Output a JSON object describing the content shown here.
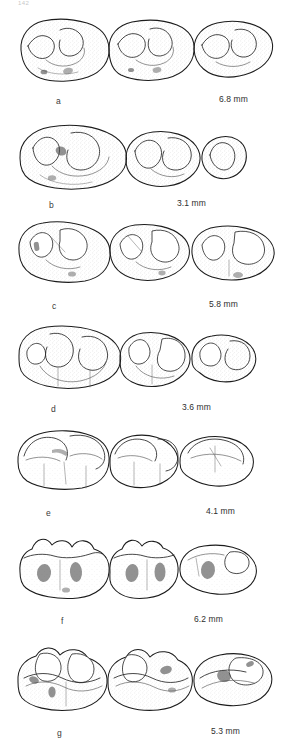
{
  "figure": {
    "page_header": "142",
    "caption_style": "letter-left, scale-right",
    "units": "mm",
    "ink_color": "#1b1b1b",
    "background_color": "#ffffff"
  },
  "rows": [
    {
      "id": "row-a",
      "letter": "a",
      "scale": "6.8 mm",
      "teeth": 3,
      "view": "occlusal",
      "letter_x": 56,
      "letter_y": 96,
      "scale_x": 219,
      "scale_y": 94
    },
    {
      "id": "row-b",
      "letter": "b",
      "scale": "3.1 mm",
      "teeth": 3,
      "view": "occlusal",
      "letter_x": 49,
      "letter_y": 190,
      "scale_x": 177,
      "scale_y": 188
    },
    {
      "id": "row-c",
      "letter": "c",
      "scale": "5.8 mm",
      "teeth": 3,
      "view": "occlusal",
      "letter_x": 52,
      "letter_y": 297,
      "scale_x": 209,
      "scale_y": 295
    },
    {
      "id": "row-d",
      "letter": "d",
      "scale": "3.6 mm",
      "teeth": 3,
      "view": "occlusal",
      "letter_x": 51,
      "letter_y": 403,
      "scale_x": 182,
      "scale_y": 401
    },
    {
      "id": "row-e",
      "letter": "e",
      "scale": "4.1 mm",
      "teeth": 3,
      "view": "occlusal",
      "letter_x": 46,
      "letter_y": 508,
      "scale_x": 206,
      "scale_y": 506
    },
    {
      "id": "row-f",
      "letter": "f",
      "scale": "6.2 mm",
      "teeth": 3,
      "view": "occlusal",
      "letter_x": 61,
      "letter_y": 615,
      "scale_x": 194,
      "scale_y": 613
    },
    {
      "id": "row-g",
      "letter": "g",
      "scale": "5.3 mm",
      "teeth": 3,
      "view": "occlusal",
      "letter_x": 57,
      "letter_y": 723,
      "scale_x": 211,
      "scale_y": 721
    }
  ]
}
